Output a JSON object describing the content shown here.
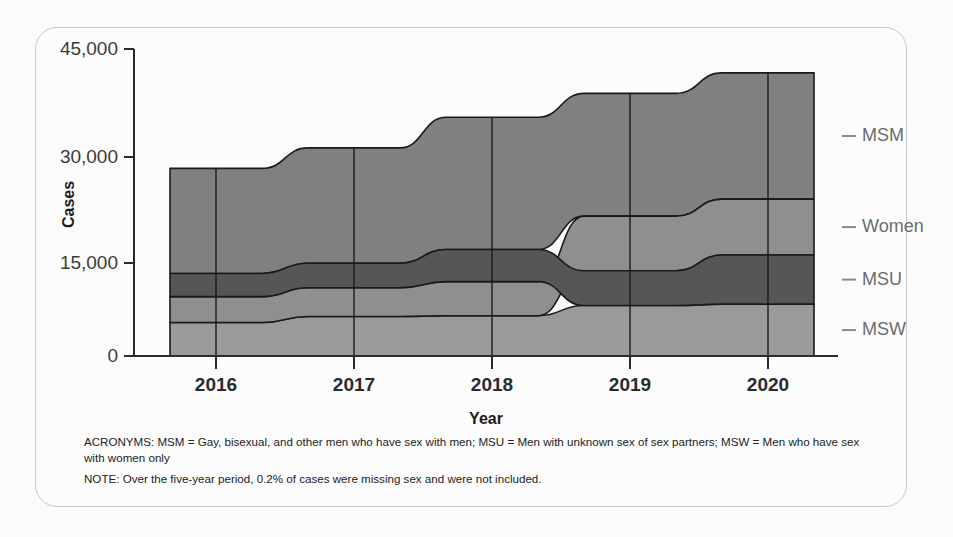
{
  "card": {
    "background": "#fcfcfc",
    "border_color": "#c9c9cb"
  },
  "axis": {
    "y_title": "Cases",
    "x_title": "Year",
    "y_ticks": [
      "45,000",
      "30,000",
      "15,000",
      "0"
    ],
    "x_ticks": [
      "2016",
      "2017",
      "2018",
      "2019",
      "2020"
    ]
  },
  "series_labels": [
    {
      "key": "MSM",
      "label": "MSM"
    },
    {
      "key": "Women",
      "label": "Women"
    },
    {
      "key": "MSU",
      "label": "MSU"
    },
    {
      "key": "MSW",
      "label": "MSW"
    }
  ],
  "colors": {
    "MSM": "#808080",
    "Women": "#8f8f8f",
    "MSU": "#565656",
    "MSW": "#9a9a9a",
    "stroke": "#1a1a1a",
    "axis": "#2b2b2b",
    "label_text": "#6d6d6d"
  },
  "footnotes": [
    "ACRONYMS: MSM = Gay, bisexual, and other men who have sex with men; MSU = Men with unknown sex of sex partners; MSW = Men who have sex with women only",
    "NOTE: Over the five-year period, 0.2% of cases were missing sex and were not included."
  ],
  "chart_data": {
    "type": "area",
    "subtype": "stacked-ribbon-bump",
    "title": "",
    "xlabel": "Year",
    "ylabel": "Cases",
    "ylim": [
      0,
      45000
    ],
    "yticks": [
      0,
      15000,
      30000,
      45000
    ],
    "grid": false,
    "legend": "right-of-plot",
    "categories": [
      "2016",
      "2017",
      "2018",
      "2019",
      "2020"
    ],
    "series": [
      {
        "name": "MSM",
        "values": [
          15400,
          16900,
          19400,
          18000,
          18500
        ]
      },
      {
        "name": "Women",
        "values": [
          3800,
          4200,
          5000,
          8000,
          8200
        ]
      },
      {
        "name": "MSU",
        "values": [
          3400,
          3600,
          4700,
          5100,
          7200
        ]
      },
      {
        "name": "MSW",
        "values": [
          4900,
          5800,
          5900,
          7400,
          7600
        ]
      }
    ],
    "totals": [
      27500,
      30500,
      35000,
      38500,
      41500
    ],
    "stack_order_by_year": {
      "2016": [
        "MSM",
        "MSU",
        "Women",
        "MSW"
      ],
      "2017": [
        "MSM",
        "MSU",
        "Women",
        "MSW"
      ],
      "2018": [
        "MSM",
        "MSU",
        "Women",
        "MSW"
      ],
      "2019": [
        "MSM",
        "Women",
        "MSU",
        "MSW"
      ],
      "2020": [
        "MSM",
        "Women",
        "MSU",
        "MSW"
      ]
    }
  }
}
